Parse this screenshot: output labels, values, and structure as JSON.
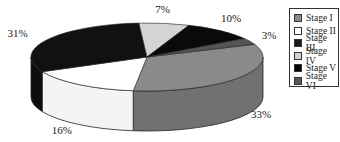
{
  "chart_data": {
    "type": "pie",
    "style": "3d-pie",
    "title": "",
    "categories": [
      "Stage I",
      "Stage II",
      "Stage III",
      "Stage IV",
      "Stage V",
      "Stage VI"
    ],
    "values": [
      33,
      16,
      31,
      7,
      10,
      3
    ],
    "labels": [
      "33%",
      "16%",
      "31%",
      "7%",
      "10%",
      "3%"
    ],
    "colors": [
      "#8a8a8a",
      "#ffffff",
      "#111111",
      "#d4d4d4",
      "#0a0a0a",
      "#555555"
    ],
    "legend_position": "right"
  },
  "legend": {
    "items": [
      {
        "label": "Stage I",
        "color": "#8a8a8a"
      },
      {
        "label": "Stage II",
        "color": "#ffffff"
      },
      {
        "label": "Stage III",
        "color": "#1a1a1a"
      },
      {
        "label": "Stage IV",
        "color": "#d4d4d4"
      },
      {
        "label": "Stage V",
        "color": "#050505"
      },
      {
        "label": "Stage VI",
        "color": "#5a5a5a"
      }
    ]
  }
}
